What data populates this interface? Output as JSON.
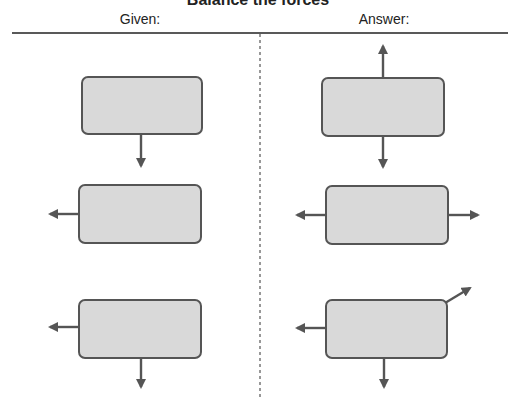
{
  "title": "Balance the forces",
  "columns": {
    "given_label": "Given:",
    "answer_label": "Answer:"
  },
  "colors": {
    "box_fill": "#d9d9d9",
    "box_stroke": "#555555",
    "arrow": "#555555",
    "rule": "#222222",
    "divider": "#777777"
  },
  "given": [
    {
      "box": "box-1",
      "forces": [
        "down"
      ]
    },
    {
      "box": "box-2",
      "forces": [
        "left"
      ]
    },
    {
      "box": "box-3",
      "forces": [
        "left",
        "down"
      ]
    }
  ],
  "answer": [
    {
      "box": "box-1",
      "forces": [
        "up",
        "down"
      ]
    },
    {
      "box": "box-2",
      "forces": [
        "left",
        "right"
      ]
    },
    {
      "box": "box-3",
      "forces": [
        "left",
        "down",
        "up-right"
      ]
    }
  ]
}
